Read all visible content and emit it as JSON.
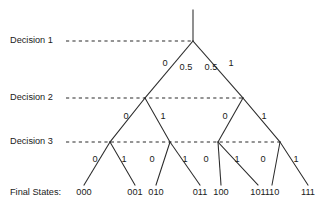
{
  "diagram": {
    "type": "binary-decision-tree",
    "title": "",
    "row_labels": [
      {
        "id": "decision-1",
        "text": "Decision 1",
        "x": 10,
        "y": 41,
        "guide_start": 66,
        "guide_end": 193
      },
      {
        "id": "decision-2",
        "text": "Decision 2",
        "x": 10,
        "y": 98,
        "guide_start": 66,
        "guide_end": 243
      },
      {
        "id": "decision-3",
        "text": "Decision 3",
        "x": 10,
        "y": 142,
        "guide_start": 66,
        "guide_end": 280
      }
    ],
    "final_states_label": "Final States:",
    "final_states_label_x": 10,
    "final_states_label_y": 193,
    "root": {
      "id": "root",
      "x": 193,
      "y": 41,
      "stem_top": 10
    },
    "level2_nodes": [
      {
        "id": "node-0",
        "x": 145,
        "y": 98
      },
      {
        "id": "node-1",
        "x": 243,
        "y": 98
      }
    ],
    "level3_nodes": [
      {
        "id": "node-00",
        "x": 110,
        "y": 142
      },
      {
        "id": "node-01",
        "x": 170,
        "y": 142
      },
      {
        "id": "node-10",
        "x": 218,
        "y": 142
      },
      {
        "id": "node-11",
        "x": 280,
        "y": 142
      }
    ],
    "leaves": [
      {
        "id": "leaf-000",
        "state": "000",
        "x": 84,
        "y": 185,
        "label_x": 84,
        "label_y": 193
      },
      {
        "id": "leaf-001",
        "state": "001",
        "x": 135,
        "y": 185,
        "label_x": 135,
        "label_y": 193
      },
      {
        "id": "leaf-010",
        "state": "010",
        "x": 156,
        "y": 185,
        "label_x": 156,
        "label_y": 193
      },
      {
        "id": "leaf-011",
        "state": "011",
        "x": 200,
        "y": 185,
        "label_x": 200,
        "label_y": 193
      },
      {
        "id": "leaf-100",
        "state": "100",
        "x": 221,
        "y": 185,
        "label_x": 221,
        "label_y": 193
      },
      {
        "id": "leaf-101",
        "state": "101",
        "x": 258,
        "y": 185,
        "label_x": 258,
        "label_y": 193
      },
      {
        "id": "leaf-110",
        "state": "110",
        "x": 272,
        "y": 185,
        "label_x": 272,
        "label_y": 193
      },
      {
        "id": "leaf-111",
        "state": "111",
        "x": 308,
        "y": 193,
        "label_x": 308,
        "label_y": 193
      }
    ],
    "edges": [
      {
        "id": "edge-root-stem",
        "x1": 193,
        "y1": 10,
        "x2": 193,
        "y2": 41
      },
      {
        "id": "edge-root-left",
        "x1": 193,
        "y1": 41,
        "x2": 145,
        "y2": 98
      },
      {
        "id": "edge-root-right",
        "x1": 193,
        "y1": 41,
        "x2": 243,
        "y2": 98
      },
      {
        "id": "edge-n0-left",
        "x1": 145,
        "y1": 98,
        "x2": 110,
        "y2": 142
      },
      {
        "id": "edge-n0-right",
        "x1": 145,
        "y1": 98,
        "x2": 170,
        "y2": 142
      },
      {
        "id": "edge-n1-left",
        "x1": 243,
        "y1": 98,
        "x2": 218,
        "y2": 142
      },
      {
        "id": "edge-n1-right",
        "x1": 243,
        "y1": 98,
        "x2": 280,
        "y2": 142
      },
      {
        "id": "edge-n00-left",
        "x1": 110,
        "y1": 142,
        "x2": 84,
        "y2": 185
      },
      {
        "id": "edge-n00-right",
        "x1": 110,
        "y1": 142,
        "x2": 135,
        "y2": 185
      },
      {
        "id": "edge-n01-left",
        "x1": 170,
        "y1": 142,
        "x2": 156,
        "y2": 185
      },
      {
        "id": "edge-n01-right",
        "x1": 170,
        "y1": 142,
        "x2": 200,
        "y2": 185
      },
      {
        "id": "edge-n10-left",
        "x1": 218,
        "y1": 142,
        "x2": 221,
        "y2": 185
      },
      {
        "id": "edge-n10-right",
        "x1": 218,
        "y1": 142,
        "x2": 258,
        "y2": 185
      },
      {
        "id": "edge-n11-left",
        "x1": 280,
        "y1": 142,
        "x2": 272,
        "y2": 185
      },
      {
        "id": "edge-n11-right",
        "x1": 280,
        "y1": 142,
        "x2": 308,
        "y2": 185
      }
    ],
    "edge_labels": [
      {
        "id": "lbl-root-left-0",
        "text": "0",
        "x": 165,
        "y": 64
      },
      {
        "id": "lbl-root-left-p",
        "text": "0.5",
        "x": 186,
        "y": 68
      },
      {
        "id": "lbl-root-right-p",
        "text": "0.5",
        "x": 211,
        "y": 68
      },
      {
        "id": "lbl-root-right-1",
        "text": "1",
        "x": 231,
        "y": 64
      },
      {
        "id": "lbl-n0-left",
        "text": "0",
        "x": 126,
        "y": 117
      },
      {
        "id": "lbl-n0-right",
        "text": "1",
        "x": 163,
        "y": 117
      },
      {
        "id": "lbl-n1-left",
        "text": "0",
        "x": 225,
        "y": 117
      },
      {
        "id": "lbl-n1-right",
        "text": "1",
        "x": 264,
        "y": 117
      },
      {
        "id": "lbl-n00-left",
        "text": "0",
        "x": 95,
        "y": 160
      },
      {
        "id": "lbl-n00-right",
        "text": "1",
        "x": 124,
        "y": 160
      },
      {
        "id": "lbl-n01-left",
        "text": "0",
        "x": 152,
        "y": 160
      },
      {
        "id": "lbl-n01-right",
        "text": "1",
        "x": 185,
        "y": 160
      },
      {
        "id": "lbl-n10-left",
        "text": "0",
        "x": 206,
        "y": 160
      },
      {
        "id": "lbl-n10-right",
        "text": "1",
        "x": 237,
        "y": 160
      },
      {
        "id": "lbl-n11-left",
        "text": "0",
        "x": 263,
        "y": 160
      },
      {
        "id": "lbl-n11-right",
        "text": "1",
        "x": 296,
        "y": 160
      }
    ],
    "colors": {
      "background": "#ffffff",
      "line": "#2b2b2b",
      "text": "#1a1a1a"
    }
  }
}
